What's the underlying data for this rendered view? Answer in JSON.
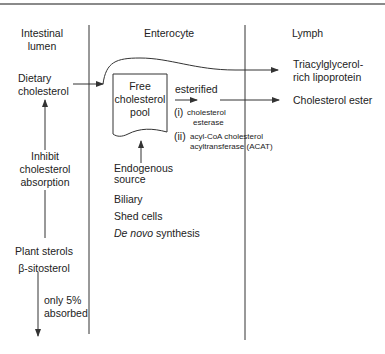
{
  "columns": {
    "lumen": {
      "line1": "Intestinal",
      "line2": "lumen"
    },
    "enterocyte": "Enterocyte",
    "lymph": "Lymph"
  },
  "lumen": {
    "dietary": {
      "line1": "Dietary",
      "line2": "cholesterol"
    },
    "inhibit": {
      "line1": "Inhibit",
      "line2": "cholesterol",
      "line3": "absorption"
    },
    "plant": {
      "line1": "Plant sterols",
      "line2": "β-sitosterol"
    },
    "absorbed": {
      "line1": "only 5%",
      "line2": "absorbed"
    }
  },
  "enterocyte": {
    "pool": {
      "line1": "Free",
      "line2": "cholesterol",
      "line3": "pool"
    },
    "esterified": "esterified",
    "enzyme1": {
      "num": "(i)",
      "line1": "cholesterol",
      "line2": "esterase"
    },
    "enzyme2": {
      "num": "(ii)",
      "line1": "acyl-CoA cholesterol",
      "line2": "acyltransferase (ACAT)"
    },
    "endogenous": {
      "line1": "Endogenous",
      "line2": "source",
      "items": [
        "Biliary",
        "Shed cells"
      ],
      "denovo_italic": "De novo",
      "denovo_rest": " synthesis"
    }
  },
  "lymph": {
    "tg": {
      "line1": "Triacylglycerol-",
      "line2": "rich lipoprotein"
    },
    "ester": "Cholesterol ester"
  },
  "colors": {
    "line": "#333333",
    "border": "#8a8a8a",
    "text": "#222222"
  }
}
